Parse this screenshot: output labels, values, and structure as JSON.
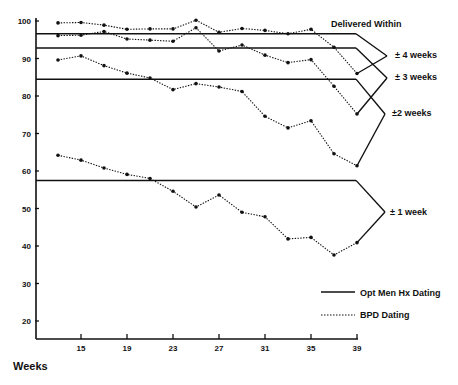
{
  "chart_data": {
    "type": "line",
    "title": "",
    "xlabel": "Weeks",
    "ylabel": "Percent",
    "xlim": [
      11,
      40
    ],
    "ylim": [
      15,
      100
    ],
    "grid": false,
    "x_ticks": [
      15,
      19,
      23,
      27,
      31,
      35,
      39
    ],
    "y_ticks": [
      20,
      30,
      40,
      50,
      60,
      70,
      80,
      90,
      100
    ],
    "x": [
      13,
      15,
      17,
      19,
      21,
      23,
      25,
      27,
      29,
      31,
      33,
      35,
      37,
      39
    ],
    "legend_title": "Delivered Within",
    "legend": [
      {
        "label": "Opt Men Hx Dating",
        "style": "solid"
      },
      {
        "label": "BPD Dating",
        "style": "dotted"
      }
    ],
    "series": [
      {
        "name": "Opt Men Hx Dating ± 4 weeks",
        "style": "solid",
        "constant": 96.6
      },
      {
        "name": "Opt Men Hx Dating ± 3 weeks",
        "style": "solid",
        "constant": 92.8
      },
      {
        "name": "Opt Men Hx Dating ±2 weeks",
        "style": "solid",
        "constant": 84.5
      },
      {
        "name": "Opt Men Hx Dating ± 1 week",
        "style": "solid",
        "constant": 57.5
      },
      {
        "name": "BPD Dating ± 4 weeks",
        "style": "dotted",
        "values": [
          99.5,
          99.6,
          98.9,
          97.8,
          97.9,
          97.9,
          100.2,
          97.0,
          98.0,
          97.5,
          96.6,
          97.8,
          93.0,
          86.0
        ]
      },
      {
        "name": "BPD Dating ± 3 weeks",
        "style": "dotted",
        "values": [
          96.1,
          96.2,
          97.2,
          95.2,
          94.9,
          94.6,
          98.2,
          92.0,
          93.6,
          90.9,
          88.9,
          89.7,
          82.6,
          75.2
        ]
      },
      {
        "name": "BPD Dating ±2 weeks",
        "style": "dotted",
        "values": [
          89.6,
          90.7,
          88.1,
          86.1,
          84.8,
          81.7,
          83.3,
          82.4,
          81.2,
          74.6,
          71.5,
          73.4,
          64.6,
          61.4
        ]
      },
      {
        "name": "BPD Dating ± 1 week",
        "style": "dotted",
        "values": [
          64.2,
          62.9,
          60.8,
          59.1,
          58.0,
          54.6,
          50.4,
          53.6,
          49.0,
          47.8,
          41.9,
          42.3,
          37.6,
          40.9
        ]
      }
    ],
    "bracket_labels": [
      "± 4 weeks",
      "± 3 weeks",
      "±2 weeks",
      "± 1 week"
    ]
  }
}
